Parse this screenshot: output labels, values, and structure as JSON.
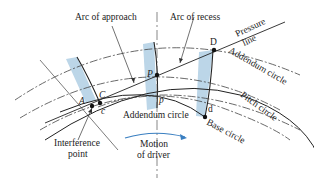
{
  "diagram": {
    "labels": {
      "arc_of_approach": "Arc of approach",
      "arc_of_recess": "Arc of recess",
      "pressure_line_1": "Pressure",
      "pressure_line_2": "line",
      "addendum_circle_top": "Addendum circle",
      "pitch_circle": "Pitch circle",
      "base_circle": "Base circle",
      "addendum_circle_bottom": "Addendum circle",
      "interference_point_1": "Interference",
      "interference_point_2": "point",
      "motion_1": "Motion",
      "motion_2": "of driver"
    },
    "points": {
      "A": "A",
      "C": "C",
      "c": "c",
      "P": "P",
      "p": "p",
      "D": "D",
      "d": "d"
    },
    "colors": {
      "tooth_fill": "#bcd6e8",
      "line": "#333333",
      "arrow": "#3a7fc1"
    }
  }
}
